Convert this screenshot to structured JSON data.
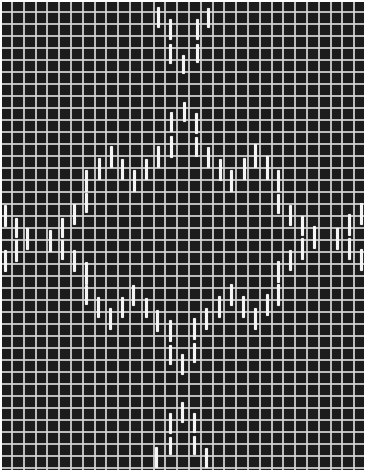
{
  "figure": {
    "description": "Woven grid pattern with white warp floats forming a diamond motif",
    "colors": {
      "background": "#1c1c1c",
      "grid": "#d7d7d7",
      "floats": "#f4f4f4",
      "border": "#ffffff"
    }
  },
  "floats": [
    {
      "x": 158,
      "y1": 7,
      "y2": 28
    },
    {
      "x": 170,
      "y1": 19,
      "y2": 40
    },
    {
      "x": 170,
      "y1": 44,
      "y2": 64
    },
    {
      "x": 183,
      "y1": 55,
      "y2": 74
    },
    {
      "x": 197,
      "y1": 19,
      "y2": 40
    },
    {
      "x": 197,
      "y1": 44,
      "y2": 63
    },
    {
      "x": 208,
      "y1": 8,
      "y2": 28
    },
    {
      "x": 171,
      "y1": 112,
      "y2": 132
    },
    {
      "x": 171,
      "y1": 136,
      "y2": 158
    },
    {
      "x": 184,
      "y1": 102,
      "y2": 122
    },
    {
      "x": 196,
      "y1": 113,
      "y2": 134
    },
    {
      "x": 196,
      "y1": 137,
      "y2": 157
    },
    {
      "x": 158,
      "y1": 146,
      "y2": 168
    },
    {
      "x": 146,
      "y1": 159,
      "y2": 180
    },
    {
      "x": 134,
      "y1": 170,
      "y2": 192
    },
    {
      "x": 122,
      "y1": 159,
      "y2": 180
    },
    {
      "x": 111,
      "y1": 146,
      "y2": 168
    },
    {
      "x": 99,
      "y1": 158,
      "y2": 180
    },
    {
      "x": 86,
      "y1": 170,
      "y2": 192
    },
    {
      "x": 86,
      "y1": 193,
      "y2": 213
    },
    {
      "x": 208,
      "y1": 147,
      "y2": 168
    },
    {
      "x": 220,
      "y1": 159,
      "y2": 181
    },
    {
      "x": 231,
      "y1": 170,
      "y2": 192
    },
    {
      "x": 244,
      "y1": 158,
      "y2": 180
    },
    {
      "x": 255,
      "y1": 144,
      "y2": 168
    },
    {
      "x": 267,
      "y1": 156,
      "y2": 180
    },
    {
      "x": 278,
      "y1": 170,
      "y2": 192
    },
    {
      "x": 278,
      "y1": 194,
      "y2": 214
    },
    {
      "x": 5,
      "y1": 205,
      "y2": 227
    },
    {
      "x": 5,
      "y1": 250,
      "y2": 272
    },
    {
      "x": 16,
      "y1": 218,
      "y2": 238
    },
    {
      "x": 16,
      "y1": 240,
      "y2": 262
    },
    {
      "x": 27,
      "y1": 228,
      "y2": 250
    },
    {
      "x": 50,
      "y1": 230,
      "y2": 252
    },
    {
      "x": 62,
      "y1": 218,
      "y2": 238
    },
    {
      "x": 62,
      "y1": 240,
      "y2": 260
    },
    {
      "x": 74,
      "y1": 204,
      "y2": 225
    },
    {
      "x": 74,
      "y1": 250,
      "y2": 272
    },
    {
      "x": 86,
      "y1": 262,
      "y2": 285
    },
    {
      "x": 86,
      "y1": 285,
      "y2": 305
    },
    {
      "x": 290,
      "y1": 205,
      "y2": 226
    },
    {
      "x": 290,
      "y1": 250,
      "y2": 271
    },
    {
      "x": 302,
      "y1": 216,
      "y2": 236
    },
    {
      "x": 302,
      "y1": 238,
      "y2": 260
    },
    {
      "x": 314,
      "y1": 226,
      "y2": 249
    },
    {
      "x": 337,
      "y1": 228,
      "y2": 250
    },
    {
      "x": 349,
      "y1": 214,
      "y2": 236
    },
    {
      "x": 349,
      "y1": 238,
      "y2": 260
    },
    {
      "x": 361,
      "y1": 203,
      "y2": 225
    },
    {
      "x": 361,
      "y1": 249,
      "y2": 271
    },
    {
      "x": 278,
      "y1": 261,
      "y2": 283
    },
    {
      "x": 278,
      "y1": 284,
      "y2": 306
    },
    {
      "x": 98,
      "y1": 297,
      "y2": 318
    },
    {
      "x": 110,
      "y1": 308,
      "y2": 330
    },
    {
      "x": 122,
      "y1": 297,
      "y2": 318
    },
    {
      "x": 133,
      "y1": 285,
      "y2": 306
    },
    {
      "x": 146,
      "y1": 298,
      "y2": 318
    },
    {
      "x": 157,
      "y1": 310,
      "y2": 332
    },
    {
      "x": 170,
      "y1": 320,
      "y2": 342
    },
    {
      "x": 170,
      "y1": 345,
      "y2": 365
    },
    {
      "x": 182,
      "y1": 354,
      "y2": 375
    },
    {
      "x": 194,
      "y1": 318,
      "y2": 340
    },
    {
      "x": 194,
      "y1": 343,
      "y2": 363
    },
    {
      "x": 206,
      "y1": 308,
      "y2": 330
    },
    {
      "x": 219,
      "y1": 296,
      "y2": 318
    },
    {
      "x": 231,
      "y1": 284,
      "y2": 306
    },
    {
      "x": 243,
      "y1": 296,
      "y2": 318
    },
    {
      "x": 255,
      "y1": 308,
      "y2": 330
    },
    {
      "x": 267,
      "y1": 294,
      "y2": 316
    },
    {
      "x": 156,
      "y1": 447,
      "y2": 468
    },
    {
      "x": 170,
      "y1": 413,
      "y2": 434
    },
    {
      "x": 170,
      "y1": 437,
      "y2": 455
    },
    {
      "x": 182,
      "y1": 402,
      "y2": 423
    },
    {
      "x": 194,
      "y1": 413,
      "y2": 433
    },
    {
      "x": 194,
      "y1": 436,
      "y2": 455
    },
    {
      "x": 206,
      "y1": 448,
      "y2": 468
    }
  ]
}
